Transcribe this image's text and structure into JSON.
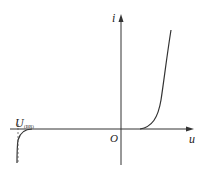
{
  "diagram": {
    "axes": {
      "y_label": "i",
      "x_label": "u",
      "origin_label": "O"
    },
    "annotations": {
      "breakdown_label_main": "U",
      "breakdown_label_sub": "(BR)"
    },
    "colors": {
      "line": "#333333",
      "background": "#ffffff"
    }
  }
}
